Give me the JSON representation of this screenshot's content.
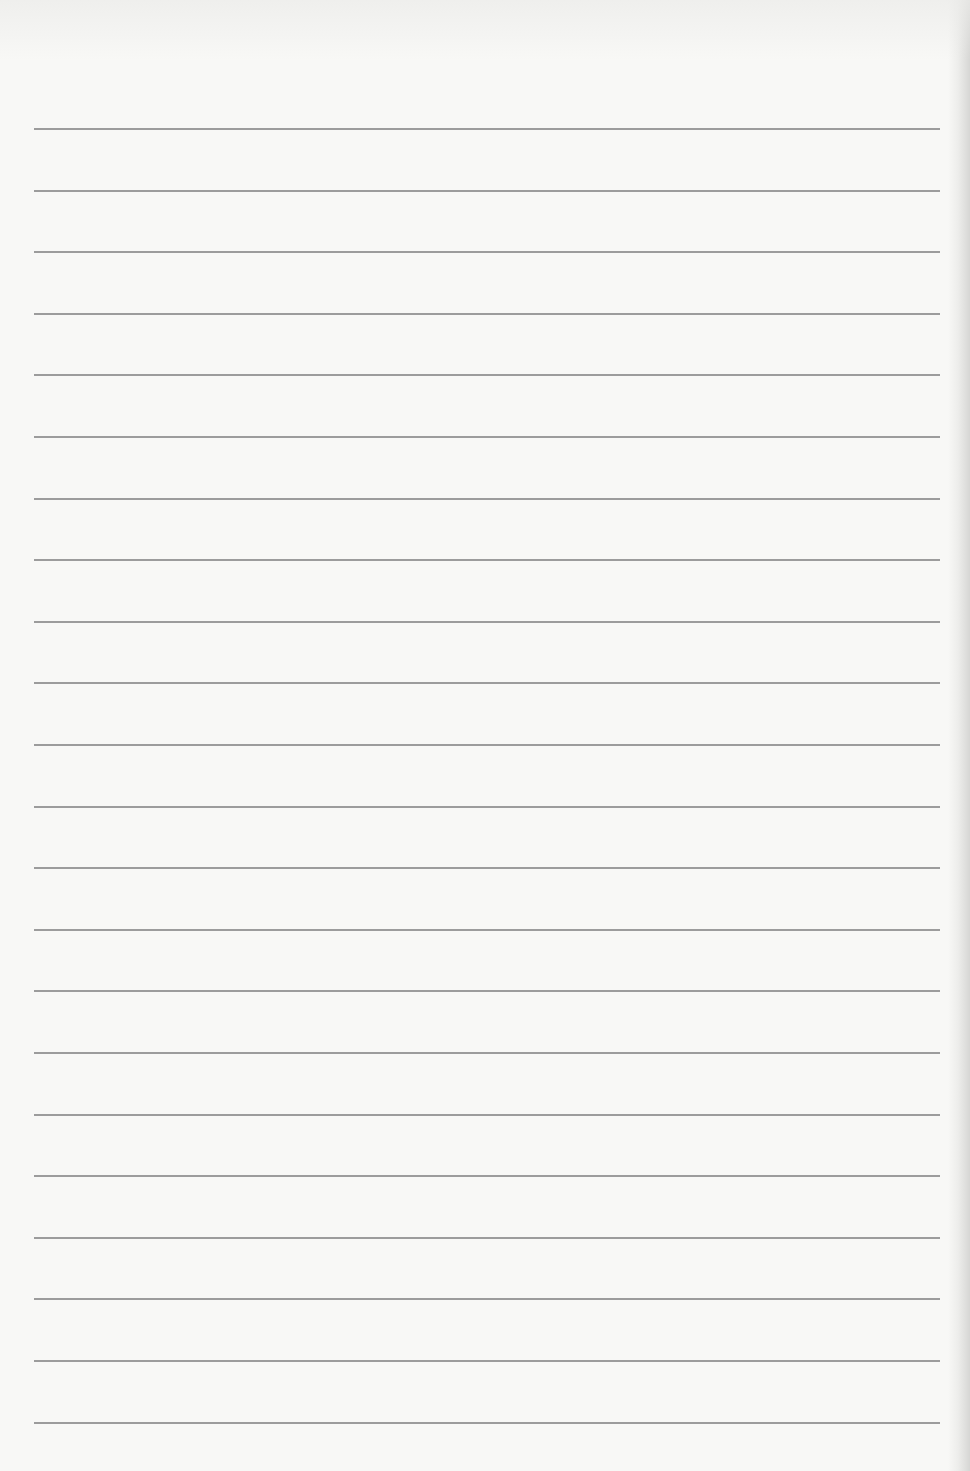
{
  "page": {
    "type": "blank ruled notebook page",
    "background_color": "#f8f8f6",
    "rule_color": "#9c9c9c",
    "rule_count": 22,
    "rule_left": 34,
    "rule_width": 906,
    "first_rule_y": 128,
    "rule_spacing": 61.6
  }
}
